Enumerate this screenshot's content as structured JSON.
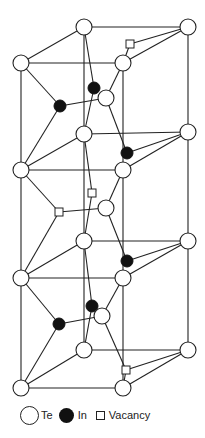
{
  "figure": {
    "type": "crystal-structure"
  },
  "legend": {
    "te_label": "Te",
    "in_label": "In",
    "vacancy_label": "Vacancy"
  },
  "colors": {
    "te_fill": "#ffffff",
    "in_fill": "#111111",
    "line": "#222222"
  }
}
